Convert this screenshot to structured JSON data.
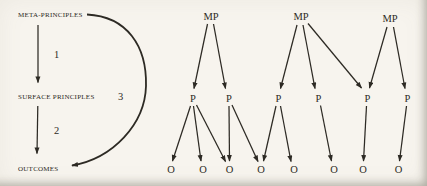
{
  "figure": {
    "left_panel": {
      "nodes": [
        {
          "id": "meta_principles",
          "label": "META-PRINCIPLES"
        },
        {
          "id": "surface_principles",
          "label": "SURFACE PRINCIPLES"
        },
        {
          "id": "outcomes",
          "label": "OUTCOMES"
        }
      ],
      "edges": [
        {
          "label": "1",
          "from": "meta_principles",
          "to": "surface_principles",
          "style": "straight"
        },
        {
          "label": "2",
          "from": "surface_principles",
          "to": "outcomes",
          "style": "straight"
        },
        {
          "label": "3",
          "from": "meta_principles",
          "to": "outcomes",
          "style": "curved"
        }
      ]
    },
    "right_panel": {
      "mp_nodes": [
        {
          "label": "MP"
        },
        {
          "label": "MP"
        },
        {
          "label": "MP"
        }
      ],
      "p_nodes": [
        {
          "label": "P"
        },
        {
          "label": "P"
        },
        {
          "label": "P"
        },
        {
          "label": "P"
        },
        {
          "label": "P"
        },
        {
          "label": "P"
        }
      ],
      "o_nodes": [
        {
          "label": "O"
        },
        {
          "label": "O"
        },
        {
          "label": "O"
        },
        {
          "label": "O"
        },
        {
          "label": "O"
        },
        {
          "label": "O"
        },
        {
          "label": "O"
        },
        {
          "label": "O"
        }
      ],
      "edges_mp_to_p": [
        [
          1,
          1
        ],
        [
          1,
          2
        ],
        [
          2,
          3
        ],
        [
          2,
          4
        ],
        [
          2,
          5
        ],
        [
          3,
          5
        ],
        [
          3,
          6
        ]
      ],
      "edges_p_to_o": [
        [
          1,
          1
        ],
        [
          1,
          2
        ],
        [
          1,
          3
        ],
        [
          2,
          3
        ],
        [
          2,
          4
        ],
        [
          3,
          4
        ],
        [
          3,
          5
        ],
        [
          4,
          6
        ],
        [
          5,
          7
        ],
        [
          6,
          8
        ]
      ]
    },
    "colors": {
      "ink": "#2d2a24",
      "paper": "#f7f4ee"
    }
  }
}
